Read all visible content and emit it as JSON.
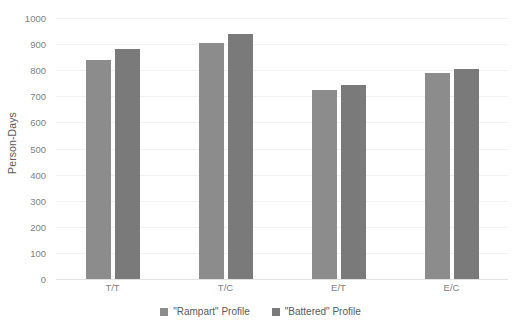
{
  "chart_data": {
    "type": "bar",
    "title": "",
    "xlabel": "",
    "ylabel": "Person-Days",
    "categories": [
      "T/T",
      "T/C",
      "E/T",
      "E/C"
    ],
    "series": [
      {
        "name": "\"Rampart\" Profile",
        "color": "#8C8C8C",
        "values": [
          840,
          905,
          723,
          790
        ]
      },
      {
        "name": "\"Battered\" Profile",
        "color": "#7A7A7A",
        "values": [
          880,
          937,
          743,
          803
        ]
      }
    ],
    "ylim": [
      0,
      1000
    ],
    "ytick_step": 100,
    "yticks": [
      "0",
      "100",
      "200",
      "300",
      "400",
      "500",
      "600",
      "700",
      "800",
      "900",
      "1000"
    ],
    "grid": true,
    "grid_axis": "y",
    "legend_position": "bottom-center",
    "background": "#FFFFFF",
    "gridline_color": "#F2F2F2",
    "axis_text_color": "#7F7F7F"
  },
  "axis": {
    "y_title": "Person-Days"
  },
  "legend": {
    "items": [
      {
        "label": "\"Rampart\" Profile"
      },
      {
        "label": "\"Battered\" Profile"
      }
    ]
  }
}
